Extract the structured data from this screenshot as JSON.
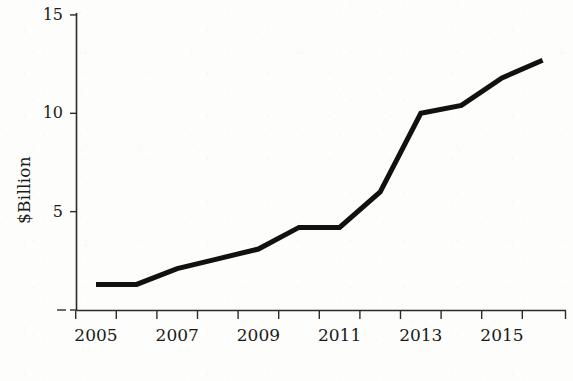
{
  "chart_data": {
    "type": "line",
    "title": "",
    "subtitle": "",
    "xlabel": "",
    "ylabel": "$Billion",
    "x": [
      2005,
      2006,
      2007,
      2008,
      2009,
      2010,
      2011,
      2012,
      2013,
      2014,
      2015,
      2016
    ],
    "values": [
      1.3,
      1.3,
      2.1,
      2.6,
      3.1,
      4.2,
      4.2,
      6.0,
      10.0,
      10.4,
      11.8,
      12.7
    ],
    "series": [
      {
        "name": "$Billion",
        "values": [
          1.3,
          1.3,
          2.1,
          2.6,
          3.1,
          4.2,
          4.2,
          6.0,
          10.0,
          10.4,
          11.8,
          12.7
        ]
      }
    ],
    "xlim": [
      2004.5,
      2016.6
    ],
    "ylim": [
      0,
      15
    ],
    "x_tick_labels": [
      "2005",
      "2007",
      "2009",
      "2011",
      "2013",
      "2015"
    ],
    "x_tick_label_values": [
      2005,
      2007,
      2009,
      2011,
      2013,
      2015
    ],
    "y_tick_labels": [
      "15",
      "10",
      "5"
    ],
    "y_tick_label_values": [
      15,
      10,
      5
    ],
    "y_unlabeled_ticks": [
      0
    ],
    "grid": false,
    "legend": false,
    "legend_position": "none",
    "line_color": "#111111",
    "axis_color": "#2b2b2b",
    "background_color": "#fdfdfb"
  },
  "axes": {
    "y_axis_title": "$Billion",
    "y_ticks": [
      {
        "label": "15",
        "value": 15
      },
      {
        "label": "10",
        "value": 10
      },
      {
        "label": "5",
        "value": 5
      },
      {
        "label": "",
        "value": 0
      }
    ],
    "x_ticks": [
      {
        "label": "2005",
        "value": 2005
      },
      {
        "label": "",
        "value": 2006
      },
      {
        "label": "2007",
        "value": 2007
      },
      {
        "label": "",
        "value": 2008
      },
      {
        "label": "2009",
        "value": 2009
      },
      {
        "label": "",
        "value": 2010
      },
      {
        "label": "2011",
        "value": 2011
      },
      {
        "label": "",
        "value": 2012
      },
      {
        "label": "2013",
        "value": 2013
      },
      {
        "label": "",
        "value": 2014
      },
      {
        "label": "2015",
        "value": 2015
      },
      {
        "label": "",
        "value": 2016
      }
    ]
  }
}
